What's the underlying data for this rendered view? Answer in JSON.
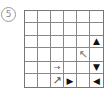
{
  "puzzle_label": "5",
  "grid": {
    "rows": 6,
    "cols": 6,
    "cells": [
      [
        "",
        "",
        "",
        "",
        "",
        ""
      ],
      [
        "",
        "",
        "",
        "",
        "",
        ""
      ],
      [
        "",
        "",
        "",
        "",
        "",
        "▲"
      ],
      [
        "",
        "",
        "",
        "",
        "↖",
        ""
      ],
      [
        "",
        "",
        "→",
        "",
        "",
        "▼"
      ],
      [
        "",
        "",
        "↗",
        "▶",
        "",
        "◀"
      ]
    ]
  }
}
